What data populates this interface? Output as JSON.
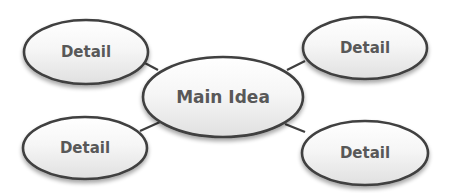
{
  "diagram": {
    "type": "mind-map",
    "colors": {
      "background": "#ffffff",
      "stroke": "#3f3f3f",
      "fill_top": "#ffffff",
      "fill_bottom": "#e2e2e2",
      "text": "#585858",
      "connector": "#3f3f3f"
    },
    "center": {
      "label": "Main Idea",
      "cx": 223,
      "cy": 97,
      "rx": 80,
      "ry": 40
    },
    "details": [
      {
        "id": "top-left",
        "label": "Detail",
        "cx": 86,
        "cy": 52,
        "rx": 62,
        "ry": 32
      },
      {
        "id": "top-right",
        "label": "Detail",
        "cx": 365,
        "cy": 48,
        "rx": 62,
        "ry": 31
      },
      {
        "id": "bottom-left",
        "label": "Detail",
        "cx": 85,
        "cy": 148,
        "rx": 62,
        "ry": 31
      },
      {
        "id": "bottom-right",
        "label": "Detail",
        "cx": 365,
        "cy": 153,
        "rx": 63,
        "ry": 32
      }
    ],
    "connectors": [
      {
        "from": "top-left",
        "x1": 141,
        "y1": 61,
        "x2": 158,
        "y2": 70
      },
      {
        "from": "top-right",
        "x1": 305,
        "y1": 61,
        "x2": 287,
        "y2": 70
      },
      {
        "from": "bottom-left",
        "x1": 140,
        "y1": 131,
        "x2": 160,
        "y2": 122
      },
      {
        "from": "bottom-right",
        "x1": 305,
        "y1": 132,
        "x2": 285,
        "y2": 124
      }
    ]
  }
}
